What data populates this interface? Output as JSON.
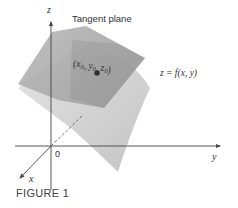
{
  "figure": {
    "caption": "FIGURE 1",
    "labels": {
      "tangent_plane": "Tangent plane",
      "point": "(x0, y0, z0)",
      "surface": "z = f(x, y)",
      "origin": "0",
      "axis_x": "x",
      "axis_y": "y",
      "axis_z": "z"
    },
    "colors": {
      "tangent_plane": "#a9a9a9",
      "tangent_plane_overlap": "#8f8f8f",
      "surface_light": "#dcdcdc",
      "surface_dark": "#bdbdbd",
      "axis": "#444444",
      "point": "#333333"
    }
  }
}
